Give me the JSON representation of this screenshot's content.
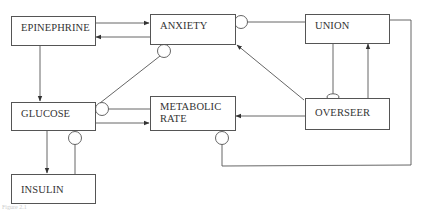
{
  "diagram": {
    "nodes": [
      {
        "id": "epinephrine",
        "label": "EPINEPHRINE"
      },
      {
        "id": "anxiety",
        "label": "ANXIETY"
      },
      {
        "id": "union",
        "label": "UNION"
      },
      {
        "id": "glucose",
        "label": "GLUCOSE"
      },
      {
        "id": "metabolic_rate",
        "label": "METABOLIC RATE",
        "lines": [
          "METABOLIC",
          "RATE"
        ]
      },
      {
        "id": "overseer",
        "label": "OVERSEER"
      },
      {
        "id": "insulin",
        "label": "INSULIN"
      }
    ],
    "edges": [
      {
        "from": "epinephrine",
        "to": "anxiety",
        "type": "arrow"
      },
      {
        "from": "anxiety",
        "to": "epinephrine",
        "type": "arrow"
      },
      {
        "from": "epinephrine",
        "to": "glucose",
        "type": "arrow"
      },
      {
        "from": "union",
        "to": "anxiety",
        "type": "inhibit-circle"
      },
      {
        "from": "glucose",
        "to": "anxiety",
        "type": "inhibit-circle"
      },
      {
        "from": "overseer",
        "to": "anxiety",
        "type": "arrow"
      },
      {
        "from": "overseer",
        "to": "union",
        "type": "arrow"
      },
      {
        "from": "union",
        "to": "overseer",
        "type": "inhibit-ellipse"
      },
      {
        "from": "metabolic_rate",
        "to": "glucose",
        "type": "inhibit-circle"
      },
      {
        "from": "glucose",
        "to": "metabolic_rate",
        "type": "arrow"
      },
      {
        "from": "overseer",
        "to": "metabolic_rate",
        "type": "arrow"
      },
      {
        "from": "union",
        "to": "metabolic_rate",
        "type": "inhibit-circle"
      },
      {
        "from": "glucose",
        "to": "insulin",
        "type": "arrow"
      },
      {
        "from": "insulin",
        "to": "glucose",
        "type": "inhibit-circle"
      }
    ],
    "caption": "Figure 2.1"
  }
}
